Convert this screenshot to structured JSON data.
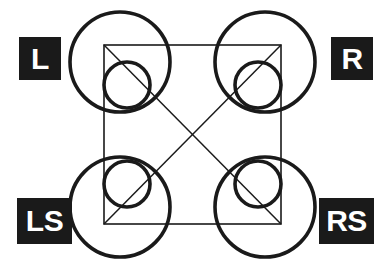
{
  "diagram": {
    "type": "speaker-layout",
    "background_color": "#ffffff",
    "stroke_color": "#1a1a1a",
    "label_box_color": "#1a1a1a",
    "label_text_color": "#ffffff",
    "square": {
      "left": 104,
      "top": 45,
      "right": 281,
      "bottom": 224,
      "stroke_width": 1.6
    },
    "diagonals": [
      {
        "name": "diagonal-tl-br",
        "x1": 104,
        "y1": 45,
        "x2": 281,
        "y2": 224
      },
      {
        "name": "diagonal-tr-bl",
        "x1": 281,
        "y1": 45,
        "x2": 104,
        "y2": 224
      }
    ],
    "circle_stroke_width": 3.6,
    "speakers": [
      {
        "id": "L",
        "label": "L",
        "position": "top-left",
        "large_circle": {
          "cx": 120,
          "cy": 62,
          "r": 50
        },
        "small_circle": {
          "cx": 127,
          "cy": 85,
          "r": 23
        }
      },
      {
        "id": "R",
        "label": "R",
        "position": "top-right",
        "large_circle": {
          "cx": 265,
          "cy": 62,
          "r": 50
        },
        "small_circle": {
          "cx": 258,
          "cy": 85,
          "r": 23
        }
      },
      {
        "id": "LS",
        "label": "LS",
        "position": "bottom-left",
        "large_circle": {
          "cx": 120,
          "cy": 207,
          "r": 50
        },
        "small_circle": {
          "cx": 127,
          "cy": 184,
          "r": 23
        }
      },
      {
        "id": "RS",
        "label": "RS",
        "position": "bottom-right",
        "large_circle": {
          "cx": 265,
          "cy": 207,
          "r": 50
        },
        "small_circle": {
          "cx": 258,
          "cy": 184,
          "r": 23
        }
      }
    ]
  }
}
